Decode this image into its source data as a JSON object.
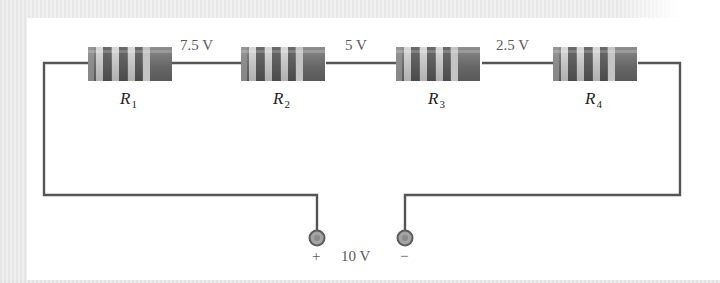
{
  "diagram": {
    "type": "series-circuit",
    "source": {
      "voltage_label": "10 V",
      "positive_label": "+",
      "negative_label": "−"
    },
    "resistors": [
      {
        "name": "R",
        "subscript": "1"
      },
      {
        "name": "R",
        "subscript": "2"
      },
      {
        "name": "R",
        "subscript": "3"
      },
      {
        "name": "R",
        "subscript": "4"
      }
    ],
    "node_voltages": [
      {
        "between": "R1-R2",
        "label": "7.5 V"
      },
      {
        "between": "R2-R3",
        "label": "5 V"
      },
      {
        "between": "R3-R4",
        "label": "2.5 V"
      }
    ],
    "colors": {
      "wire": "#555555",
      "resistor_body_dark": "#6e6e6e",
      "resistor_band_light": "#c8c8c8",
      "terminal_fill": "#9a9a9a",
      "text": "#5a5a5a"
    }
  }
}
